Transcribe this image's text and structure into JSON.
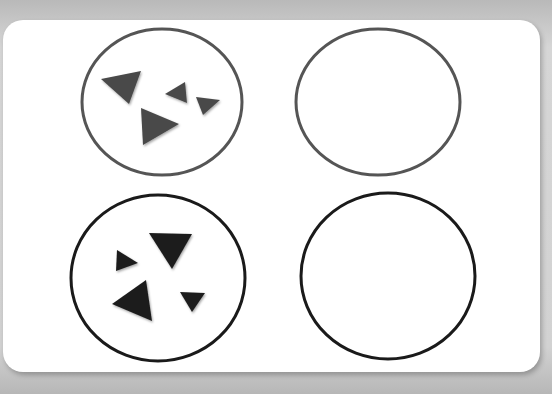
{
  "diagram": {
    "colors": {
      "background": "#c8c8c8",
      "card": "#ffffff",
      "top_stroke": "#555555",
      "bottom_stroke": "#1a1a1a",
      "top_triangles": "#4a4a4a",
      "bottom_triangles": "#1e1e1e"
    },
    "circles": [
      {
        "id": "top-left",
        "cx": 162,
        "cy": 102,
        "rx": 80,
        "ry": 73,
        "stroke": "#555555",
        "triangles": 4
      },
      {
        "id": "top-right",
        "cx": 378,
        "cy": 102,
        "rx": 82,
        "ry": 73,
        "stroke": "#555555",
        "triangles": 0
      },
      {
        "id": "bottom-left",
        "cx": 158,
        "cy": 278,
        "rx": 87,
        "ry": 83,
        "stroke": "#1a1a1a",
        "triangles": 4
      },
      {
        "id": "bottom-right",
        "cx": 388,
        "cy": 276,
        "rx": 87,
        "ry": 83,
        "stroke": "#1a1a1a",
        "triangles": 0
      }
    ],
    "triangles": {
      "top-left": [
        "101,79 141,71 129,104",
        "165,94 185,82 187,103",
        "196,97 220,100 203,115",
        "141,108 179,124 143,145"
      ],
      "bottom-left": [
        "149,233 192,234 172,269",
        "117,250 138,263 116,271",
        "112,304 146,280 152,321",
        "180,292 205,293 192,312"
      ]
    }
  }
}
